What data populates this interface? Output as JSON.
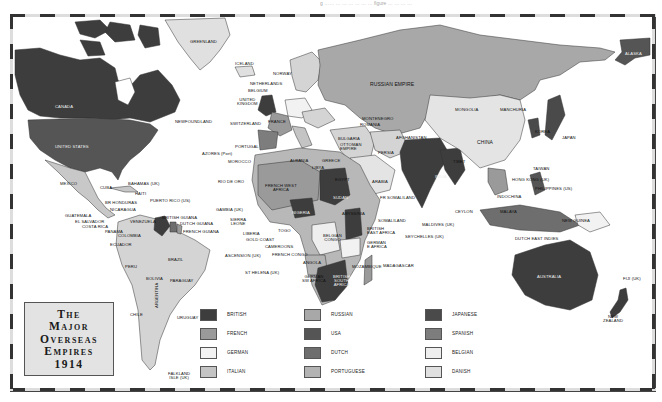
{
  "page_top_text": "g …… … … … … … … figure … … … …",
  "title": {
    "lines": [
      "The",
      "Major",
      "Overseas",
      "Empires",
      "1914"
    ]
  },
  "legend": [
    {
      "label": "BRITISH",
      "color": "#3d3d3d"
    },
    {
      "label": "FRENCH",
      "color": "#9a9a9a"
    },
    {
      "label": "GERMAN",
      "color": "#f2f2f2"
    },
    {
      "label": "ITALIAN",
      "color": "#c4c4c4"
    },
    {
      "label": "RUSSIAN",
      "color": "#a8a8a8"
    },
    {
      "label": "USA",
      "color": "#555555"
    },
    {
      "label": "DUTCH",
      "color": "#6e6e6e"
    },
    {
      "label": "PORTUGUESE",
      "color": "#b3b3b3"
    },
    {
      "label": "JAPANESE",
      "color": "#4a4a4a"
    },
    {
      "label": "SPANISH",
      "color": "#7d7d7d"
    },
    {
      "label": "BELGIAN",
      "color": "#eeeeee"
    },
    {
      "label": "DANISH",
      "color": "#e0e0e0"
    }
  ],
  "labels": {
    "greenland": "GREENLAND",
    "iceland": "ICELAND",
    "norway": "NORWAY",
    "sweden": "SWEDEN",
    "netherlands": "NETHERLANDS",
    "belgium": "BELGIUM",
    "uk": "UNITED\nKINGDOM",
    "denmark": "DENMARK",
    "germany": "GERMANY",
    "switzerland": "SWITZERLAND",
    "france": "FRANCE",
    "austria_hungary": "AUSTRIA-\nHUNGARY",
    "montenegro": "MONTENEGRO",
    "romania": "ROMANIA",
    "serbia": "SERBIA",
    "bulgaria": "BULGARIA",
    "ottoman": "OTTOMAN\nEMPIRE",
    "spain": "SPAIN",
    "portugal": "PORTUGAL",
    "italy": "ITALY",
    "albania": "ALBANIA",
    "greece": "GREECE",
    "azores": "AZORES (Port)",
    "morocco": "MOROCCO",
    "rio_de_oro": "RIO DE ORO",
    "russian_empire": "RUSSIAN EMPIRE",
    "alaska": "ALASKA",
    "canada": "CANADA",
    "newfoundland": "NEWFOUNDLAND",
    "usa": "UNITED STATES",
    "mexico": "MEXICO",
    "cuba": "CUBA",
    "bahamas": "BAHAMAS (UK)",
    "haiti": "HAITI",
    "br_honduras": "BR HONDURAS",
    "puerto_rico": "PUERTO RICO (US)",
    "nicaragua": "NICARAGUA",
    "guatemala": "GUATEMALA",
    "el_salvador": "EL SALVADOR",
    "costa_rica": "COSTA RICA",
    "panama": "PANAMA",
    "venezuela": "VENEZUELA",
    "colombia": "COLOMBIA",
    "ecuador": "ECUADOR",
    "british_guiana": "BRITISH GUIANA",
    "dutch_guiana": "DUTCH GUIANA",
    "french_guiana": "FRENCH GUIANA",
    "brazil": "BRAZIL",
    "peru": "PERU",
    "bolivia": "BOLIVIA",
    "paraguay": "PARAGUAY",
    "chile": "CHILE",
    "argentina": "ARGENTINA",
    "uruguay": "URUGUAY",
    "falkland": "FALKLAND\nISLE (UK)",
    "mongolia": "MONGOLIA",
    "manchuria": "MANCHURIA",
    "china": "CHINA",
    "korea": "KOREA",
    "japan": "JAPAN",
    "tibet": "TIBET",
    "afghanistan": "AFGHANISTAN",
    "persia": "PERSIA",
    "arabia": "ARABIA",
    "india": "INDIA",
    "ceylon": "CEYLON",
    "maldives": "MALDIVES (UK)",
    "seychelles": "SEYCHELLES (UK)",
    "taiwan": "TAIWAN",
    "hong_kong": "HONG KONG (UK)",
    "philippines": "PHILIPPINES (US)",
    "indochina": "INDOCHINA",
    "malaya": "MALAYA",
    "new_guinea": "NEW GUINEA",
    "dutch_east_indies": "DUTCH EAST INDIES",
    "australia": "AUSTRALIA",
    "fiji": "FIJI (UK)",
    "new_zealand": "NEW\nZEALAND",
    "libya": "LIBYA",
    "egypt": "EGYPT",
    "french_west_africa": "FRENCH WEST\nAFRICA",
    "sudan": "SUDAN",
    "abyssinia": "ABYSSINIA",
    "fr_somaliland": "FR SOMALILAND",
    "somaliland": "SOMALILAND",
    "gambia": "GAMBIA (UK)",
    "sierra_leone": "SIERRA\nLEONE",
    "liberia": "LIBERIA",
    "gold_coast": "GOLD COAST",
    "togo": "TOGO",
    "nigeria": "NIGERIA",
    "cameroons": "CAMEROONS",
    "french_congo": "FRENCH CONGO",
    "belgian_congo": "BELGIAN\nCONGO",
    "british_east_africa": "BRITISH\nEAST AFRICA",
    "german_east_africa": "GERMAN\nE AFRICA",
    "ascension": "ASCENSION (UK)",
    "st_helena": "ST HELENA (UK)",
    "angola": "ANGOLA",
    "german_sw_africa": "GERMAN\nSW AFRICA",
    "british_south_africa": "BRITISH\nSOUTH\nAFRICA",
    "mozambique": "MOZAMBIQUE",
    "madagascar": "MADAGASCAR"
  }
}
